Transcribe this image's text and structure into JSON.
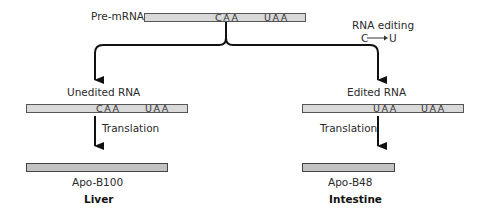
{
  "diagram": {
    "top": {
      "label": "Pre-mRNA",
      "codons": [
        "CAA",
        "UAA"
      ]
    },
    "editing_annotation": {
      "title": "RNA editing",
      "change_from": "C",
      "arrow": "→",
      "change_to": "U"
    },
    "left_branch": {
      "rna_label": "Unedited RNA",
      "codons": [
        "CAA",
        "UAA"
      ],
      "step_label": "Translation",
      "protein_label": "Apo-B100",
      "tissue_label": "Liver"
    },
    "right_branch": {
      "rna_label": "Edited RNA",
      "codons": [
        "UAA",
        "UAA"
      ],
      "step_label": "Translation",
      "protein_label": "Apo-B48",
      "tissue_label": "Intestine"
    },
    "colors": {
      "rna_bar_fill": "#d9d9d9",
      "protein_bar_fill": "#c2c2c2",
      "outline": "#555555",
      "arrow": "#111111"
    }
  }
}
